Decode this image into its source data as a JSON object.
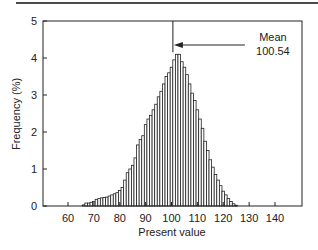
{
  "chart_data": {
    "type": "bar",
    "title": "",
    "xlabel": "Present value",
    "ylabel": "Frequency (%)",
    "xlim": [
      51,
      150
    ],
    "ylim": [
      0,
      5
    ],
    "xticks": [
      60,
      70,
      80,
      90,
      100,
      110,
      120,
      130,
      140
    ],
    "yticks": [
      0,
      1,
      2,
      3,
      4,
      5
    ],
    "grid": false,
    "legend": "none",
    "bin_width": 1,
    "x": [
      66,
      67,
      68,
      69,
      70,
      71,
      72,
      73,
      74,
      75,
      76,
      77,
      78,
      79,
      80,
      81,
      82,
      83,
      84,
      85,
      86,
      87,
      88,
      89,
      90,
      91,
      92,
      93,
      94,
      95,
      96,
      97,
      98,
      99,
      100,
      101,
      102,
      103,
      104,
      105,
      106,
      107,
      108,
      109,
      110,
      111,
      112,
      113,
      114,
      115,
      116,
      117,
      118,
      119,
      120,
      121,
      122,
      123,
      124,
      125
    ],
    "values": [
      0.03,
      0.08,
      0.08,
      0.1,
      0.12,
      0.18,
      0.2,
      0.22,
      0.23,
      0.24,
      0.27,
      0.3,
      0.33,
      0.36,
      0.42,
      0.5,
      0.7,
      0.9,
      1.0,
      1.1,
      1.3,
      1.65,
      1.8,
      1.9,
      2.2,
      2.35,
      2.45,
      2.6,
      2.75,
      2.95,
      3.1,
      3.3,
      3.5,
      3.6,
      3.75,
      3.95,
      4.1,
      4.1,
      3.9,
      3.75,
      3.55,
      3.3,
      3.05,
      2.85,
      2.6,
      2.35,
      2.1,
      1.75,
      1.5,
      1.25,
      1.05,
      0.85,
      0.7,
      0.55,
      0.4,
      0.3,
      0.2,
      0.12,
      0.06,
      0.02
    ],
    "annotations": [
      {
        "label": "Mean",
        "value_text": "100.54",
        "x": 100.54
      }
    ]
  }
}
